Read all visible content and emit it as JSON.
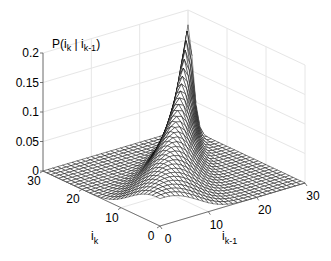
{
  "chart_data": {
    "type": "surface",
    "title": "",
    "xlabel": "i_{k-1}",
    "ylabel": "i_k",
    "zlabel": "P(i_k | i_{k-1})",
    "zlabel_parts": {
      "main": "P(i",
      "sub1": "k",
      "mid": " | i",
      "sub2": "k-1",
      "end": ")"
    },
    "xlabel_parts": {
      "main": "i",
      "sub": "k-1"
    },
    "ylabel_parts": {
      "main": "i",
      "sub": "k"
    },
    "xlim": [
      0,
      30
    ],
    "ylim": [
      0,
      30
    ],
    "zlim": [
      0,
      0.2
    ],
    "xticks": [
      0,
      10,
      20,
      30
    ],
    "yticks": [
      0,
      10,
      20,
      30
    ],
    "zticks": [
      0,
      0.05,
      0.1,
      0.15,
      0.2
    ],
    "zticklabels": [
      "0",
      "0.05",
      "0.1",
      "0.15",
      "0.2"
    ],
    "grid": true,
    "mesh_color": "#000000",
    "grid_color": "#e6e6e6",
    "peak": {
      "i_k": 30,
      "i_k_minus_1": 30,
      "value": 0.17
    },
    "grid_points": 31
  }
}
